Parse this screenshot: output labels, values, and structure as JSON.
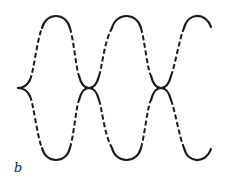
{
  "figure": {
    "panel_label": "b",
    "stroke_color": "#1a1a1a",
    "background": "#ffffff"
  }
}
